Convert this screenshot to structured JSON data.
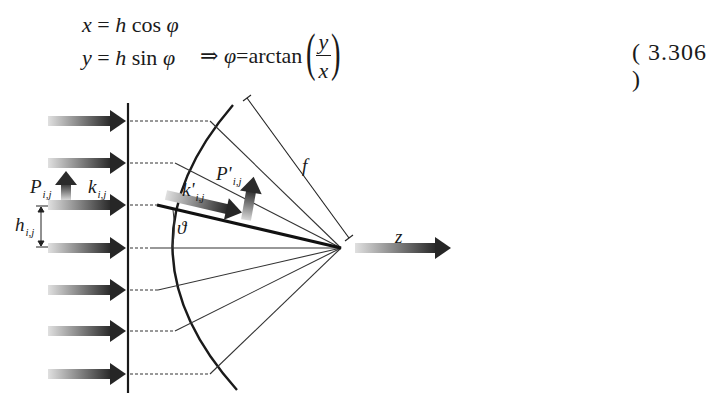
{
  "equation": {
    "line1": {
      "lhs": "x",
      "eq": " = ",
      "h": "h",
      "fn": "cos",
      "var": "φ"
    },
    "line2": {
      "lhs": "y",
      "eq": " = ",
      "h": "h",
      "fn": "sin",
      "var": "φ"
    },
    "implies": "⇒",
    "result_var": "φ",
    "result_eq": " = ",
    "result_fn": "arctan",
    "frac_num": "y",
    "frac_den": "x",
    "number": "( 3.306 )"
  },
  "figure": {
    "labels": {
      "P": "P",
      "P_sub": "i,j",
      "k": "k",
      "k_sub": "i,j",
      "h": "h",
      "h_sub": "i,j",
      "k_prime": "k'",
      "k_prime_sub": "i,j",
      "P_prime": "P'",
      "P_prime_sub": "i,j",
      "theta": "ϑ",
      "f": "f",
      "z": "z"
    },
    "ray_rows_y": [
      121,
      163,
      205,
      248,
      290,
      331,
      374
    ],
    "arc_hits_x": [
      210,
      175,
      157,
      152,
      158,
      175,
      210
    ],
    "focus": {
      "x": 341,
      "y": 248
    },
    "colors": {
      "ink": "#1a1a1a",
      "arrow_dark": "#2b2b2b",
      "arrow_light": "#d0d0d0"
    }
  }
}
